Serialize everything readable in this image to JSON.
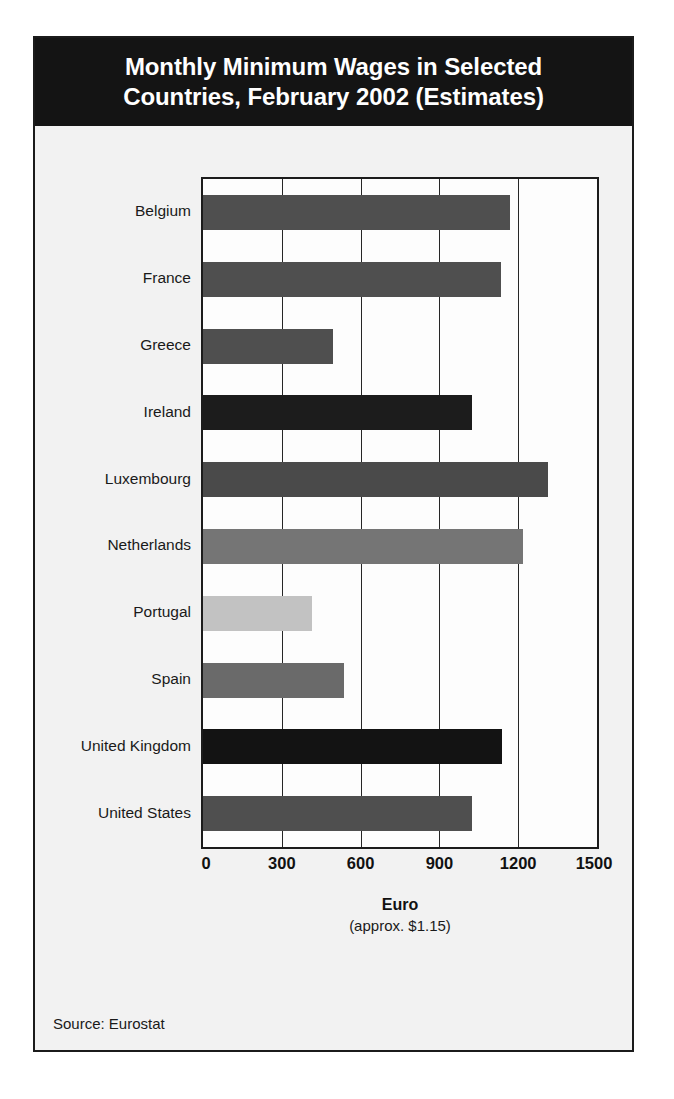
{
  "figure": {
    "title_lines": [
      "Monthly Minimum Wages in Selected",
      "Countries, February 2002 (Estimates)"
    ],
    "source_note": "Source: Eurostat",
    "axis_title": "Euro",
    "axis_subtitle": "(approx. $1.15)",
    "title_band_color": "#141414",
    "frame_color": "#1b1b1b",
    "panel_background": "#f2f2f2"
  },
  "chart_data": {
    "type": "bar",
    "orientation": "horizontal",
    "title": "Monthly Minimum Wages in Selected Countries, February 2002 (Estimates)",
    "xlabel": "Euro",
    "xlabel_note": "(approx. $1.15)",
    "ylabel": "",
    "xlim": [
      0,
      1500
    ],
    "xticks": [
      0,
      300,
      600,
      900,
      1200,
      1500
    ],
    "xtick_labels": [
      "0",
      "300",
      "600",
      "900",
      "1200",
      "1500"
    ],
    "grid": "vertical gridlines at every 300 units",
    "legend": "none",
    "source": "Source: Eurostat",
    "categories": [
      "Belgium",
      "France",
      "Greece",
      "Ireland",
      "Luxembourg",
      "Netherlands",
      "Portugal",
      "Spain",
      "United Kingdom",
      "United States"
    ],
    "values": [
      1170,
      1135,
      495,
      1025,
      1315,
      1220,
      415,
      535,
      1140,
      1025
    ],
    "bar_colors": [
      "#4f4f4f",
      "#4f4f4f",
      "#4f4f4f",
      "#1c1c1c",
      "#4a4a4a",
      "#757575",
      "#c2c2c2",
      "#6a6a6a",
      "#131313",
      "#4f4f4f"
    ],
    "bars": [
      {
        "category": "Belgium",
        "value": 1170,
        "color": "#4f4f4f"
      },
      {
        "category": "France",
        "value": 1135,
        "color": "#4f4f4f"
      },
      {
        "category": "Greece",
        "value": 495,
        "color": "#4f4f4f"
      },
      {
        "category": "Ireland",
        "value": 1025,
        "color": "#1c1c1c"
      },
      {
        "category": "Luxembourg",
        "value": 1315,
        "color": "#4a4a4a"
      },
      {
        "category": "Netherlands",
        "value": 1220,
        "color": "#757575"
      },
      {
        "category": "Portugal",
        "value": 415,
        "color": "#c2c2c2"
      },
      {
        "category": "Spain",
        "value": 535,
        "color": "#6a6a6a"
      },
      {
        "category": "United Kingdom",
        "value": 1140,
        "color": "#131313"
      },
      {
        "category": "United States",
        "value": 1025,
        "color": "#4f4f4f"
      }
    ]
  }
}
